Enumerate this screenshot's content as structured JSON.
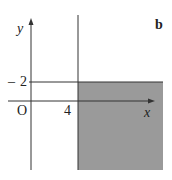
{
  "diagram": {
    "panel_label": "b",
    "axes": {
      "y_label": "y",
      "x_label": "x",
      "origin_label": "O"
    },
    "ticks": {
      "x_tick": "4",
      "y_tick": "2",
      "y_tick_prefix": "–"
    },
    "lines": [
      {
        "name": "x = 4",
        "type": "vertical"
      },
      {
        "name": "y = 2",
        "type": "horizontal"
      }
    ],
    "region": {
      "description": "x >= 4 and y <= 2",
      "fill_color": "#9a9a9a"
    },
    "colors": {
      "line": "#333333",
      "shade": "#9a9a9a"
    }
  }
}
